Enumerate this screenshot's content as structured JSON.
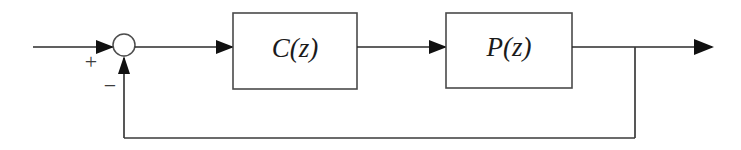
{
  "diagram": {
    "type": "control-system-block-diagram",
    "blocks": [
      {
        "id": "controller",
        "label": "C(z)",
        "x": 233,
        "y": 13,
        "width": 124,
        "height": 76,
        "label_x": 295,
        "label_y": 51
      },
      {
        "id": "plant",
        "label": "P(z)",
        "x": 446,
        "y": 13,
        "width": 126,
        "height": 75,
        "label_x": 509,
        "label_y": 50
      }
    ],
    "summing_junction": {
      "id": "summer",
      "cx": 124,
      "cy": 45,
      "r": 11,
      "positive_sign": "+",
      "negative_sign": "−",
      "positive_sign_x": 91,
      "positive_sign_y": 64,
      "negative_sign_x": 110,
      "negative_sign_y": 88
    },
    "signals": {
      "input_line_start_x": 33,
      "input_line_y": 47,
      "forward_line_y": 47,
      "output_arrow_tip_x": 712,
      "feedback_tap_x": 635,
      "feedback_line_y": 138,
      "feedback_return_x": 124
    },
    "colors": {
      "line": "#2b2b2b",
      "block_stroke": "#4a4a4a",
      "label": "#1b1b1b",
      "background": "#ffffff"
    }
  }
}
